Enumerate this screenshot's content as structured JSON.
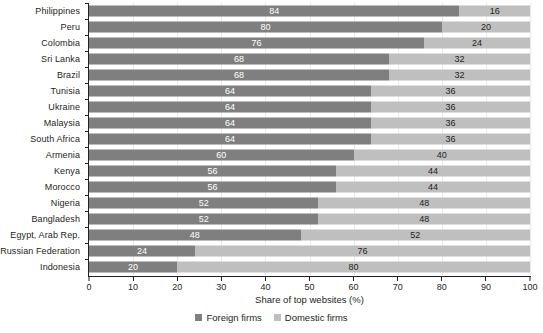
{
  "chart_data": {
    "type": "bar",
    "orientation": "horizontal",
    "stacked": true,
    "title": "",
    "xlabel": "Share of top websites (%)",
    "ylabel": "",
    "xlim": [
      0,
      100
    ],
    "xticks": [
      0,
      10,
      20,
      30,
      40,
      50,
      60,
      70,
      80,
      90,
      100
    ],
    "grid": true,
    "legend_position": "bottom-center",
    "categories": [
      "Philippines",
      "Peru",
      "Colombia",
      "Sri Lanka",
      "Brazil",
      "Tunisia",
      "Ukraine",
      "Malaysia",
      "South Africa",
      "Armenia",
      "Kenya",
      "Morocco",
      "Nigeria",
      "Bangladesh",
      "Egypt, Arab Rep.",
      "Russian Federation",
      "Indonesia"
    ],
    "series": [
      {
        "name": "Foreign firms",
        "color": "#7f7f7f",
        "values": [
          84,
          80,
          76,
          68,
          68,
          64,
          64,
          64,
          64,
          60,
          56,
          56,
          52,
          52,
          48,
          24,
          20
        ]
      },
      {
        "name": "Domestic firms",
        "color": "#bfbfbf",
        "values": [
          16,
          20,
          24,
          32,
          32,
          36,
          36,
          36,
          36,
          40,
          44,
          44,
          48,
          48,
          52,
          76,
          80
        ]
      }
    ]
  },
  "legend": {
    "items": [
      {
        "label": "Foreign firms",
        "color": "#7f7f7f"
      },
      {
        "label": "Domestic firms",
        "color": "#bfbfbf"
      }
    ]
  },
  "axis": {
    "x_title": "Share of top websites (%)",
    "x_tick_labels": [
      "0",
      "10",
      "20",
      "30",
      "40",
      "50",
      "60",
      "70",
      "80",
      "90",
      "100"
    ]
  },
  "colors": {
    "foreign": "#7f7f7f",
    "domestic": "#bfbfbf",
    "axis": "#231f20",
    "gridline": "#e9e9e9",
    "background": "#ffffff"
  }
}
